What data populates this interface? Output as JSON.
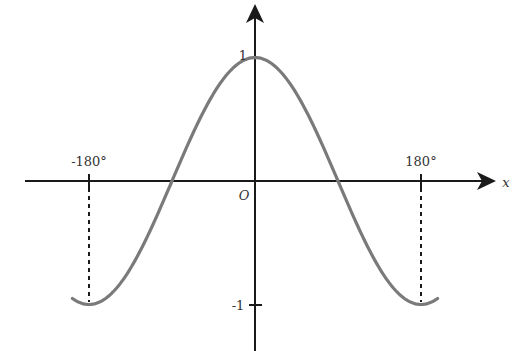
{
  "chart_data": {
    "type": "line",
    "title": "",
    "function": "y = cos x",
    "xlabel": "x",
    "ylabel": "",
    "origin_label": "O",
    "x_ticks": [
      {
        "value": -180,
        "label": "-180°"
      },
      {
        "value": 180,
        "label": "180°"
      }
    ],
    "y_ticks": [
      {
        "value": 1,
        "label": "1"
      },
      {
        "value": -1,
        "label": "-1"
      }
    ],
    "x_domain_deg": [
      -198,
      198
    ],
    "ylim": [
      -1.3,
      1.5
    ],
    "grid": false,
    "series": [
      {
        "name": "cos x",
        "x": [
          -198,
          -180,
          -135,
          -90,
          -45,
          0,
          45,
          90,
          135,
          180,
          198
        ],
        "values": [
          -0.95,
          -1,
          -0.71,
          0,
          0.71,
          1,
          0.71,
          0,
          -0.71,
          -1,
          -0.95
        ]
      }
    ],
    "annotations": [
      {
        "type": "dashed-vertical",
        "x": -180,
        "from_y": 0,
        "to_y": -1
      },
      {
        "type": "dashed-vertical",
        "x": 180,
        "from_y": 0,
        "to_y": -1
      }
    ],
    "colors": {
      "curve": "#7a7a7a",
      "axes": "#1a1a1a"
    }
  },
  "labels": {
    "x_axis": "x",
    "origin": "O",
    "tick_neg180": "-180°",
    "tick_pos180": "180°",
    "tick_y1": "1",
    "tick_yneg1": "-1"
  }
}
